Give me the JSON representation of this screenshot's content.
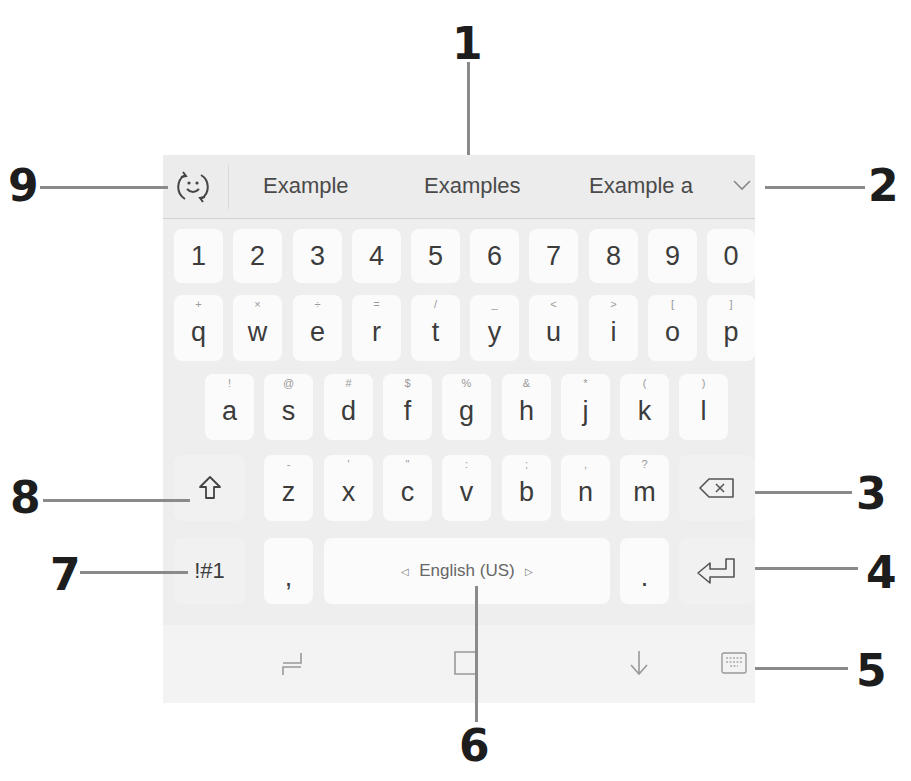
{
  "callouts": [
    {
      "id": "1",
      "target": "suggestion-center"
    },
    {
      "id": "2",
      "target": "expand-suggestions"
    },
    {
      "id": "3",
      "target": "backspace-key"
    },
    {
      "id": "4",
      "target": "enter-key"
    },
    {
      "id": "5",
      "target": "keyboard-toggle"
    },
    {
      "id": "6",
      "target": "space-bar"
    },
    {
      "id": "7",
      "target": "symbols-key"
    },
    {
      "id": "8",
      "target": "shift-key"
    },
    {
      "id": "9",
      "target": "emoji-button"
    }
  ],
  "suggestions": {
    "items": [
      "Example",
      "Examples",
      "Example a"
    ],
    "emoji_icon": "emoji-refresh-icon",
    "expand_icon": "chevron-down-icon"
  },
  "rows": {
    "numbers": [
      "1",
      "2",
      "3",
      "4",
      "5",
      "6",
      "7",
      "8",
      "9",
      "0"
    ],
    "top": [
      {
        "key": "q",
        "sub": "+"
      },
      {
        "key": "w",
        "sub": "×"
      },
      {
        "key": "e",
        "sub": "÷"
      },
      {
        "key": "r",
        "sub": "="
      },
      {
        "key": "t",
        "sub": "/"
      },
      {
        "key": "y",
        "sub": "_"
      },
      {
        "key": "u",
        "sub": "<"
      },
      {
        "key": "i",
        "sub": ">"
      },
      {
        "key": "o",
        "sub": "["
      },
      {
        "key": "p",
        "sub": "]"
      }
    ],
    "home": [
      {
        "key": "a",
        "sub": "!"
      },
      {
        "key": "s",
        "sub": "@"
      },
      {
        "key": "d",
        "sub": "#"
      },
      {
        "key": "f",
        "sub": "$"
      },
      {
        "key": "g",
        "sub": "%"
      },
      {
        "key": "h",
        "sub": "&"
      },
      {
        "key": "j",
        "sub": "*"
      },
      {
        "key": "k",
        "sub": "("
      },
      {
        "key": "l",
        "sub": ")"
      }
    ],
    "bottom": [
      {
        "key": "z",
        "sub": "-"
      },
      {
        "key": "x",
        "sub": "'"
      },
      {
        "key": "c",
        "sub": "\""
      },
      {
        "key": "v",
        "sub": ":"
      },
      {
        "key": "b",
        "sub": ";"
      },
      {
        "key": "n",
        "sub": ","
      },
      {
        "key": "m",
        "sub": "?"
      }
    ]
  },
  "function_keys": {
    "shift_icon": "shift-arrow-icon",
    "backspace_icon": "backspace-icon",
    "symbols_label": "!#1",
    "comma_label": ",",
    "space_label": "English (US)",
    "period_label": ".",
    "enter_icon": "enter-icon"
  },
  "toolbar": {
    "icons": [
      "cursor-move-icon",
      "clipboard-icon",
      "hide-keyboard-icon",
      "keyboard-switch-icon"
    ]
  }
}
